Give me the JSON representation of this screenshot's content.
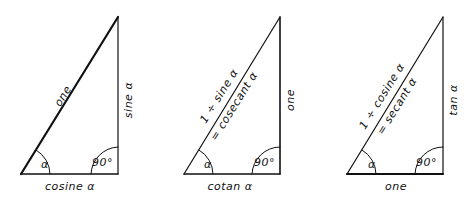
{
  "diagram": {
    "triangles": [
      {
        "id": "sine-cosine",
        "hypotenuse": "one",
        "opposite": "sine α",
        "adjacent": "cosine α",
        "angle": "α",
        "right_angle": "90°"
      },
      {
        "id": "cosecant-cotan",
        "hypotenuse_line1": "1 ÷ sine α",
        "hypotenuse_line2": "= cosecant α",
        "opposite": "one",
        "adjacent": "cotan α",
        "angle": "α",
        "right_angle": "90°"
      },
      {
        "id": "secant-tan",
        "hypotenuse_line1": "1 ÷ cosine α",
        "hypotenuse_line2": "= secant α",
        "opposite": "tan α",
        "adjacent": "one",
        "angle": "α",
        "right_angle": "90°"
      }
    ]
  }
}
